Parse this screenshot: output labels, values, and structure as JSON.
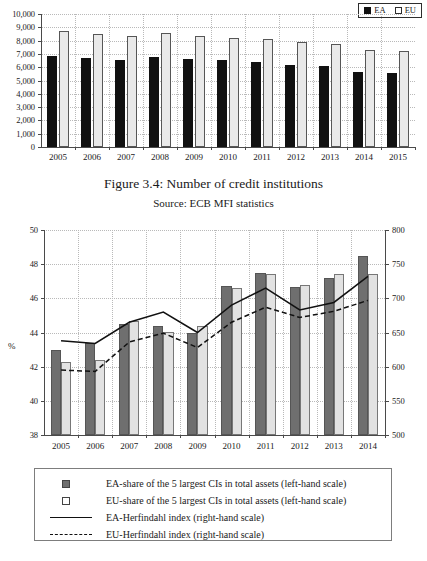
{
  "caption": {
    "figure": "Figure 3.4: Number of credit institutions",
    "source": "Source: ECB MFI statistics"
  },
  "chart_data": [
    {
      "id": "credit-institutions",
      "type": "bar",
      "title": "Figure 3.4: Number of credit institutions",
      "xlabel": "",
      "ylabel": "",
      "ylim": [
        0,
        10000
      ],
      "yticks": [
        0,
        1000,
        2000,
        3000,
        4000,
        5000,
        6000,
        7000,
        8000,
        9000,
        10000
      ],
      "ytick_labels": [
        "0",
        "1,000",
        "2,000",
        "3,000",
        "4,000",
        "5,000",
        "6,000",
        "7,000",
        "8,000",
        "9,000",
        "10,000"
      ],
      "grid": true,
      "legend_position": "top-right",
      "categories": [
        "2005",
        "2006",
        "2007",
        "2008",
        "2009",
        "2010",
        "2011",
        "2012",
        "2013",
        "2014",
        "2015"
      ],
      "series": [
        {
          "name": "EA",
          "color": "#111111",
          "values": [
            6850,
            6680,
            6520,
            6780,
            6600,
            6520,
            6370,
            6200,
            6060,
            5620,
            5530
          ]
        },
        {
          "name": "EU",
          "color": "#e9e9e9",
          "values": [
            8740,
            8520,
            8360,
            8570,
            8380,
            8230,
            8100,
            7890,
            7760,
            7320,
            7200
          ]
        }
      ]
    },
    {
      "id": "concentration-herfindahl",
      "type": "bar+line",
      "title": "",
      "xlabel": "",
      "ylabel": "%",
      "ylim": [
        38,
        50
      ],
      "yticks": [
        38,
        40,
        42,
        44,
        46,
        48,
        50
      ],
      "ylim_right": [
        500,
        800
      ],
      "yticks_right": [
        500,
        550,
        600,
        650,
        700,
        750,
        800
      ],
      "grid": true,
      "legend_position": "below",
      "categories": [
        "2005",
        "2006",
        "2007",
        "2008",
        "2009",
        "2010",
        "2011",
        "2012",
        "2013",
        "2014"
      ],
      "series": [
        {
          "name": "EA-share of the 5 largest CIs in total assets (left-hand scale)",
          "type": "bar",
          "axis": "left",
          "color": "#6f6f6f",
          "values": [
            43.0,
            43.4,
            44.5,
            44.4,
            44.0,
            46.7,
            47.5,
            46.65,
            47.2,
            48.5
          ]
        },
        {
          "name": "EU-share of the 5 largest CIs in total assets (left-hand scale)",
          "type": "bar",
          "axis": "left",
          "color": "#e2e2e2",
          "values": [
            42.25,
            42.4,
            44.7,
            44.05,
            44.4,
            46.6,
            47.45,
            46.8,
            47.45,
            47.45
          ]
        },
        {
          "name": "EA-Herfindahl index (right-hand scale)",
          "type": "line",
          "axis": "right",
          "style": "solid",
          "color": "#111111",
          "values": [
            638,
            634,
            665,
            680,
            650,
            690,
            715,
            683,
            694,
            732
          ]
        },
        {
          "name": "EU-Herfindahl index (right-hand scale)",
          "type": "line",
          "axis": "right",
          "style": "dashed",
          "color": "#111111",
          "values": [
            595,
            593,
            636,
            649,
            628,
            665,
            687,
            672,
            681,
            697
          ]
        }
      ]
    }
  ],
  "top_chart": {
    "legend": [
      {
        "label": "EA",
        "swatch": "filled-square-black"
      },
      {
        "label": "EU",
        "swatch": "open-square"
      }
    ]
  },
  "bottom_chart": {
    "axis_label_left": "%",
    "legend": [
      {
        "label": "EA-share of the 5 largest CIs in total assets (left-hand scale)",
        "key": "filled-square-gray"
      },
      {
        "label": "EU-share of the 5 largest CIs in total assets (left-hand scale)",
        "key": "open-square"
      },
      {
        "label": "EA-Herfindahl index (right-hand scale)",
        "key": "solid-line"
      },
      {
        "label": "EU-Herfindahl index (right-hand scale)",
        "key": "dashed-line"
      }
    ]
  }
}
